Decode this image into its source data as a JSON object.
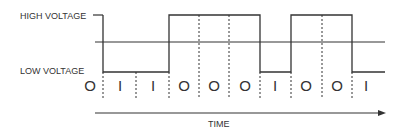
{
  "labels": {
    "high": "HIGH VOLTAGE",
    "low": "LOW VOLTAGE",
    "time": "TIME"
  },
  "bits": [
    "O",
    "I",
    "I",
    "O",
    "O",
    "O",
    "I",
    "O",
    "O",
    "I"
  ],
  "colors": {
    "line": "#333333",
    "background": "#ffffff"
  }
}
